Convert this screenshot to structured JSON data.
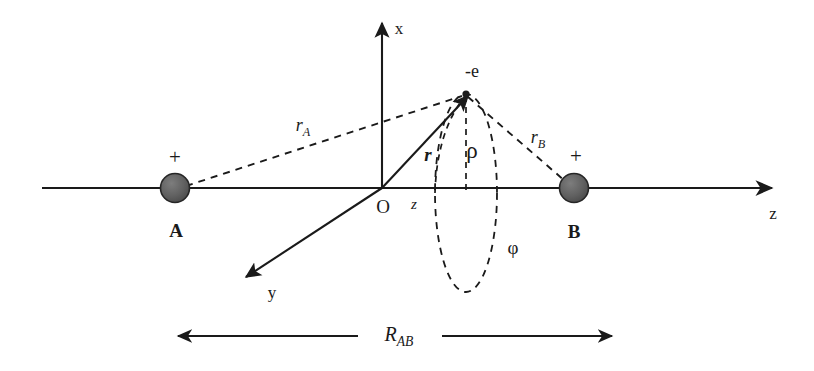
{
  "figure": {
    "kind": "physics-diagram",
    "background_color": "#ffffff",
    "line_color": "#1a1a1a",
    "nucleus_fill": "#5a5a5a",
    "nucleus_stroke": "#262626",
    "width": 814,
    "height": 371
  },
  "axes": {
    "x_label": "x",
    "y_label": "y",
    "z_label": "z"
  },
  "nuclei": [
    {
      "name": "A",
      "charge_sign": "+",
      "label": "A"
    },
    {
      "name": "B",
      "charge_sign": "+",
      "label": "B"
    }
  ],
  "origin": {
    "label": "O"
  },
  "electron": {
    "label": "-e"
  },
  "coordinates": {
    "z_component": "z",
    "rho": "ρ",
    "phi": "φ",
    "position_vector": "r"
  },
  "distances": {
    "r_A_base": "r",
    "r_A_sub": "A",
    "r_B_base": "r",
    "r_B_sub": "B",
    "R_AB_base": "R",
    "R_AB_sub": "AB"
  }
}
